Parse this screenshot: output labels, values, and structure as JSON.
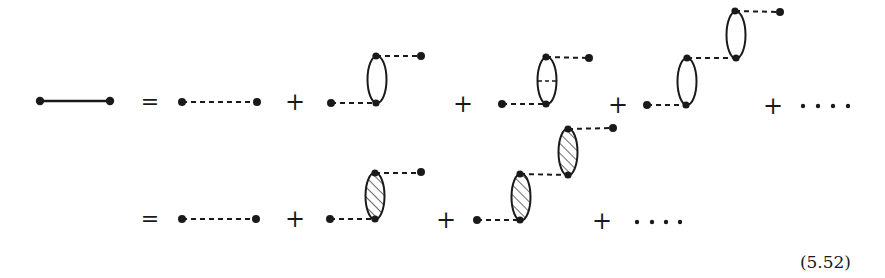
{
  "diagram": {
    "colors": {
      "ink": "#1a1a1a",
      "background": "#ffffff"
    },
    "rows": [
      {
        "id": "row-1",
        "lhs": "full-propagator",
        "equals": "=",
        "terms": [
          {
            "type": "bare-propagator"
          },
          {
            "operator": "+",
            "type": "single-bubble"
          },
          {
            "operator": "+",
            "type": "bubble-with-internal-exchange"
          },
          {
            "operator": "+",
            "type": "double-bubble-chain"
          },
          {
            "operator": "+",
            "type": "ellipsis",
            "text": "· · · ·"
          }
        ]
      },
      {
        "id": "row-2",
        "equals": "=",
        "terms": [
          {
            "type": "bare-propagator"
          },
          {
            "operator": "+",
            "type": "single-hatched-bubble"
          },
          {
            "operator": "+",
            "type": "double-hatched-bubble-chain"
          },
          {
            "operator": "+",
            "type": "ellipsis",
            "text": "· · · ·"
          }
        ]
      }
    ],
    "symbols": {
      "equals": "=",
      "plus": "+"
    },
    "equation_number": "(5.52)"
  }
}
